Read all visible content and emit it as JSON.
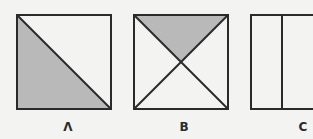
{
  "figure": {
    "colors": {
      "background": "#f3f3f1",
      "stroke": "#2a2a2a",
      "shade": "#b9b9b9",
      "unshaded": "#f3f3f1"
    },
    "panels": [
      {
        "id": "A",
        "label": "Λ",
        "description": "Square divided by a diagonal from top-left to bottom-right; lower-left triangle shaded",
        "shaded_fraction": 0.5
      },
      {
        "id": "B",
        "label": "B",
        "description": "Square divided by both diagonals; top triangle shaded",
        "shaded_fraction": 0.25
      },
      {
        "id": "C",
        "label": "C",
        "description": "Rectangle divided by a vertical line into two parts; no shading",
        "shaded_fraction": 0
      }
    ]
  }
}
